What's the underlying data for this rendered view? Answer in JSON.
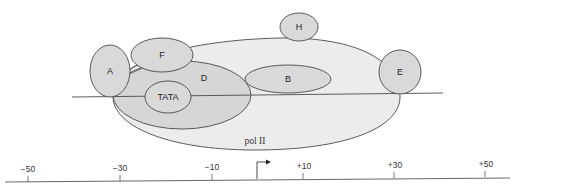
{
  "diagram": {
    "title": "",
    "colors": {
      "background": "#ffffff",
      "stroke": "#4a4a4a",
      "pol_ii_fill": "#ececec",
      "factor_fill": "#d9d9d9",
      "d_fill": "#d6d6d6",
      "axis": "#555555"
    },
    "factors": [
      {
        "id": "A",
        "label": "A"
      },
      {
        "id": "F",
        "label": "F"
      },
      {
        "id": "D",
        "label": "D"
      },
      {
        "id": "TATA",
        "label": "TATA"
      },
      {
        "id": "B",
        "label": "B"
      },
      {
        "id": "H",
        "label": "H"
      },
      {
        "id": "E",
        "label": "E"
      },
      {
        "id": "polII",
        "label": "pol II"
      }
    ],
    "axis": {
      "ticks": [
        "−50",
        "−30",
        "−10",
        "+10",
        "+30",
        "+50"
      ],
      "start_site_marker": "transcription-start-arrow"
    }
  }
}
